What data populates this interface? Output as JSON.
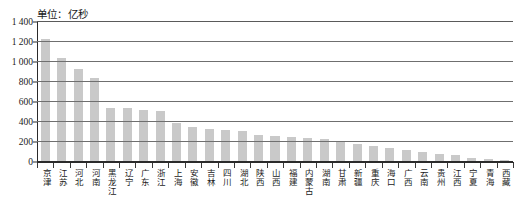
{
  "chart_data": {
    "type": "bar",
    "title": "单位：亿秒",
    "xlabel": "",
    "ylabel": "",
    "ylim": [
      0,
      1400
    ],
    "yticks": [
      0,
      200,
      400,
      600,
      800,
      1000,
      1200,
      1400
    ],
    "ytick_labels": [
      "0",
      "200",
      "400",
      "600",
      "800",
      "1 000",
      "1 200",
      "1 400"
    ],
    "grid": true,
    "legend": "none",
    "bar_color": "#c9c9c9",
    "axis_color": "#2b2b2b",
    "gridline_color": "#6f6f6f",
    "categories": [
      "京津",
      "江苏",
      "河北",
      "河南",
      "黑龙江",
      "辽宁",
      "广东",
      "浙江",
      "上海",
      "安徽",
      "吉林",
      "四川",
      "湖北",
      "陕西",
      "山西",
      "福建",
      "内蒙古",
      "湖南",
      "甘肃",
      "新疆",
      "重庆",
      "海口",
      "广西",
      "云南",
      "贵州",
      "江西",
      "宁夏",
      "青海",
      "西藏"
    ],
    "values": [
      1230,
      1045,
      930,
      840,
      545,
      540,
      525,
      510,
      395,
      355,
      335,
      325,
      310,
      275,
      265,
      250,
      240,
      235,
      215,
      180,
      160,
      140,
      120,
      105,
      85,
      70,
      45,
      30,
      22
    ]
  }
}
